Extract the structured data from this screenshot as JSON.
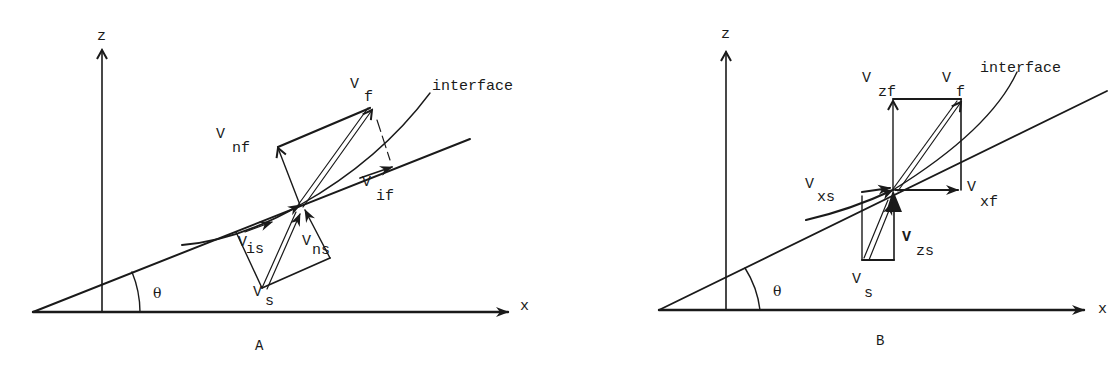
{
  "panels": [
    {
      "id": "A",
      "caption": "A",
      "axis_labels": {
        "z": "z",
        "x": "x",
        "angle": "θ"
      },
      "interface_label": "interface",
      "vectors": {
        "vf": {
          "main": "V",
          "sub": "f"
        },
        "vnf": {
          "main": "V",
          "sub": "nf"
        },
        "vif": {
          "main": "V",
          "sub": "if"
        },
        "vis": {
          "main": "V",
          "sub": "is"
        },
        "vns": {
          "main": "V",
          "sub": "ns"
        },
        "vs": {
          "main": "V",
          "sub": "s"
        }
      }
    },
    {
      "id": "B",
      "caption": "B",
      "axis_labels": {
        "z": "z",
        "x": "x",
        "angle": "θ"
      },
      "interface_label": "interface",
      "vectors": {
        "vzf": {
          "main": "V",
          "sub": "zf"
        },
        "vf": {
          "main": "V",
          "sub": "f"
        },
        "vxs": {
          "main": "V",
          "sub": "xs"
        },
        "vxf": {
          "main": "V",
          "sub": "xf"
        },
        "vzs": {
          "main": "V",
          "sub": "zs"
        },
        "vs": {
          "main": "V",
          "sub": "s"
        }
      }
    }
  ],
  "colors": {
    "ink": "#1a1a1a",
    "background": "#ffffff"
  }
}
